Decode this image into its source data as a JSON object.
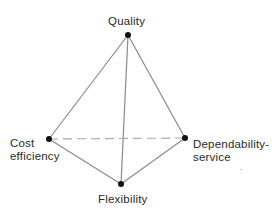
{
  "diagram": {
    "type": "tetrahedron",
    "nodes": [
      {
        "id": "quality",
        "label_lines": [
          "Quality"
        ],
        "x": 128,
        "y": 35
      },
      {
        "id": "cost",
        "label_lines": [
          "Cost",
          "efficiency"
        ],
        "x": 49,
        "y": 139
      },
      {
        "id": "dependability",
        "label_lines": [
          "Dependability-",
          "service"
        ],
        "x": 185,
        "y": 138
      },
      {
        "id": "flexibility",
        "label_lines": [
          "Flexibility"
        ],
        "x": 121,
        "y": 184
      }
    ],
    "edges": [
      {
        "from": "quality",
        "to": "cost",
        "style": "solid"
      },
      {
        "from": "quality",
        "to": "dependability",
        "style": "solid"
      },
      {
        "from": "quality",
        "to": "flexibility",
        "style": "solid"
      },
      {
        "from": "cost",
        "to": "flexibility",
        "style": "solid"
      },
      {
        "from": "dependability",
        "to": "flexibility",
        "style": "solid"
      },
      {
        "from": "cost",
        "to": "dependability",
        "style": "dashed"
      }
    ],
    "colors": {
      "edge": "#8a8a8a",
      "hidden_edge": "#a8a8a8",
      "vertex": "#111111",
      "text": "#2a2a2a",
      "background": "#ffffff"
    }
  }
}
